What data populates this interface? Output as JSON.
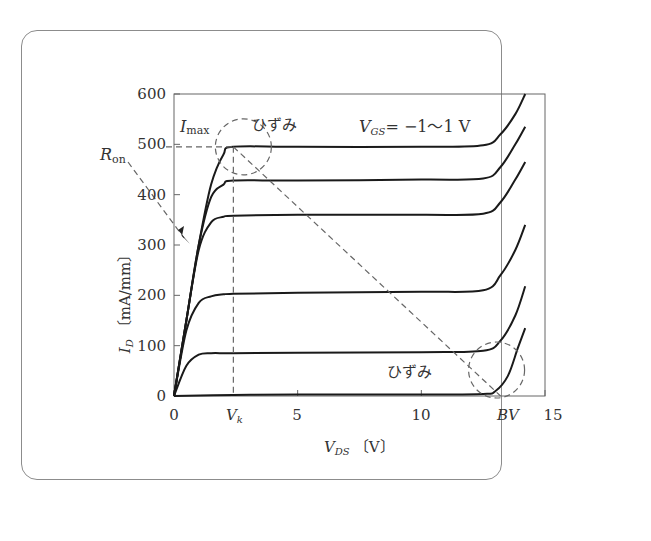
{
  "chart_data": {
    "type": "line",
    "title": "",
    "xlabel": "V_DS [V]",
    "ylabel": "I_D [mA/mm]",
    "xlim": [
      0,
      15
    ],
    "ylim": [
      0,
      600
    ],
    "x_ticks": [
      0,
      5,
      10,
      15
    ],
    "x_tick_labels": [
      "0",
      "5",
      "10",
      "15"
    ],
    "y_ticks": [
      0,
      100,
      200,
      300,
      400,
      500,
      600
    ],
    "y_tick_labels": [
      "0",
      "100",
      "200",
      "300",
      "400",
      "500",
      "600"
    ],
    "grid": false,
    "legend": "none",
    "parameter_label": "V_GS = −1〜1 V",
    "series": [
      {
        "name": "V_GS = 1 V",
        "x": [
          0,
          0.5,
          1.0,
          1.5,
          2.0,
          2.4,
          5,
          10,
          12.5,
          13.2,
          13.8,
          14.2
        ],
        "y": [
          0,
          150,
          300,
          420,
          480,
          495,
          495,
          495,
          498,
          520,
          560,
          600
        ]
      },
      {
        "name": "V_GS level 2",
        "x": [
          0,
          0.5,
          1.0,
          1.5,
          2.0,
          2.4,
          5,
          10,
          12.5,
          13.2,
          13.8,
          14.2
        ],
        "y": [
          0,
          150,
          300,
          395,
          420,
          428,
          428,
          430,
          432,
          455,
          500,
          535
        ]
      },
      {
        "name": "V_GS level 3",
        "x": [
          0,
          0.5,
          1.0,
          1.5,
          2.0,
          2.4,
          5,
          10,
          12.5,
          13.2,
          13.8,
          14.2
        ],
        "y": [
          0,
          150,
          290,
          345,
          356,
          358,
          360,
          360,
          362,
          385,
          430,
          465
        ]
      },
      {
        "name": "V_GS level 4",
        "x": [
          0,
          0.5,
          1.0,
          1.5,
          2.0,
          2.4,
          5,
          10,
          12.5,
          13.2,
          13.8,
          14.2
        ],
        "y": [
          0,
          130,
          185,
          198,
          202,
          203,
          205,
          207,
          210,
          240,
          290,
          340
        ]
      },
      {
        "name": "V_GS level 5",
        "x": [
          0,
          0.5,
          1.0,
          1.5,
          2.0,
          2.4,
          5,
          10,
          12.5,
          13.2,
          13.8,
          14.2
        ],
        "y": [
          0,
          60,
          82,
          85,
          85,
          85,
          86,
          87,
          90,
          110,
          160,
          218
        ]
      },
      {
        "name": "V_GS = −1 V",
        "x": [
          0,
          2.4,
          5,
          10,
          12.5,
          13.0,
          13.5,
          13.9,
          14.2
        ],
        "y": [
          0,
          2,
          3,
          3,
          4,
          10,
          40,
          95,
          135
        ]
      }
    ],
    "annotations": [
      {
        "text": "I_max",
        "x": 0.5,
        "y": 520,
        "note": "dashed horizontal line at I_max ≈ 495"
      },
      {
        "text": "ひずみ",
        "x": 3.4,
        "y": 522,
        "note": "dashed circle around knee of top curve"
      },
      {
        "text": "V_GS = −1〜1 V",
        "x": 8,
        "y": 520
      },
      {
        "text": "R_on",
        "x": -1.5,
        "y": 475,
        "note": "dashed arrow pointing to linear region slope"
      },
      {
        "text": "ひずみ",
        "x": 8.8,
        "y": 45,
        "note": "dashed circle around breakdown region"
      },
      {
        "text": "V_k",
        "x": 2.4,
        "y": 0,
        "note": "knee voltage; dashed vertical line from I_max"
      },
      {
        "text": "BV",
        "x": 12.8,
        "y": 0,
        "note": "breakdown voltage"
      },
      {
        "text": "load line",
        "note": "dashed diagonal from (V_k, I_max) to (BV, 0)"
      }
    ]
  },
  "labels": {
    "y_axis": {
      "main": "I",
      "sub": "D",
      "unit": "〔mA/mm〕"
    },
    "x_axis": {
      "main": "V",
      "sub": "DS",
      "unit": "〔V〕"
    },
    "imax": {
      "main": "I",
      "sub": "max"
    },
    "ron": {
      "main": "R",
      "sub": "on"
    },
    "hizumi_top": "ひずみ",
    "hizumi_bottom": "ひずみ",
    "vgs": {
      "main": "V",
      "sub": "GS",
      "rest": "= −1〜1 V"
    },
    "vk": {
      "main": "V",
      "sub": "k"
    },
    "bv": "BV",
    "x_ticks": [
      "0",
      "5",
      "10",
      "15"
    ],
    "y_ticks": [
      "0",
      "100",
      "200",
      "300",
      "400",
      "500",
      "600"
    ]
  },
  "colors": {
    "curve": "#1a1a1a",
    "dashed": "#666666",
    "axis": "#555555",
    "frame": "#8c8c8c"
  }
}
